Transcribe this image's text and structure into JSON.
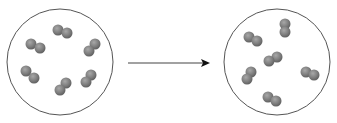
{
  "diagram": {
    "colors": {
      "circle": "#555555",
      "atom": "#7a7a7a",
      "atom_highlight": "#9a9a9a",
      "arrow": "#444444"
    },
    "left_container": {
      "cx": 60,
      "cy": 62,
      "r": 53,
      "molecules": [
        {
          "x1": 58,
          "y1": 30,
          "x2": 67,
          "y2": 33
        },
        {
          "x1": 31,
          "y1": 44,
          "x2": 40,
          "y2": 48
        },
        {
          "x1": 95,
          "y1": 44,
          "x2": 89,
          "y2": 51
        },
        {
          "x1": 26,
          "y1": 71,
          "x2": 34,
          "y2": 78
        },
        {
          "x1": 91,
          "y1": 75,
          "x2": 86,
          "y2": 82
        },
        {
          "x1": 66,
          "y1": 83,
          "x2": 60,
          "y2": 90
        }
      ]
    },
    "right_container": {
      "cx": 277,
      "cy": 62,
      "r": 53,
      "molecules": [
        {
          "x1": 285,
          "y1": 24,
          "x2": 285,
          "y2": 32
        },
        {
          "x1": 249,
          "y1": 37,
          "x2": 257,
          "y2": 41
        },
        {
          "x1": 277,
          "y1": 57,
          "x2": 269,
          "y2": 61
        },
        {
          "x1": 251,
          "y1": 72,
          "x2": 247,
          "y2": 79
        },
        {
          "x1": 306,
          "y1": 72,
          "x2": 314,
          "y2": 75
        },
        {
          "x1": 268,
          "y1": 97,
          "x2": 276,
          "y2": 101
        }
      ]
    },
    "arrow": {
      "x1": 128,
      "y1": 63,
      "x2": 210,
      "y2": 63
    }
  }
}
